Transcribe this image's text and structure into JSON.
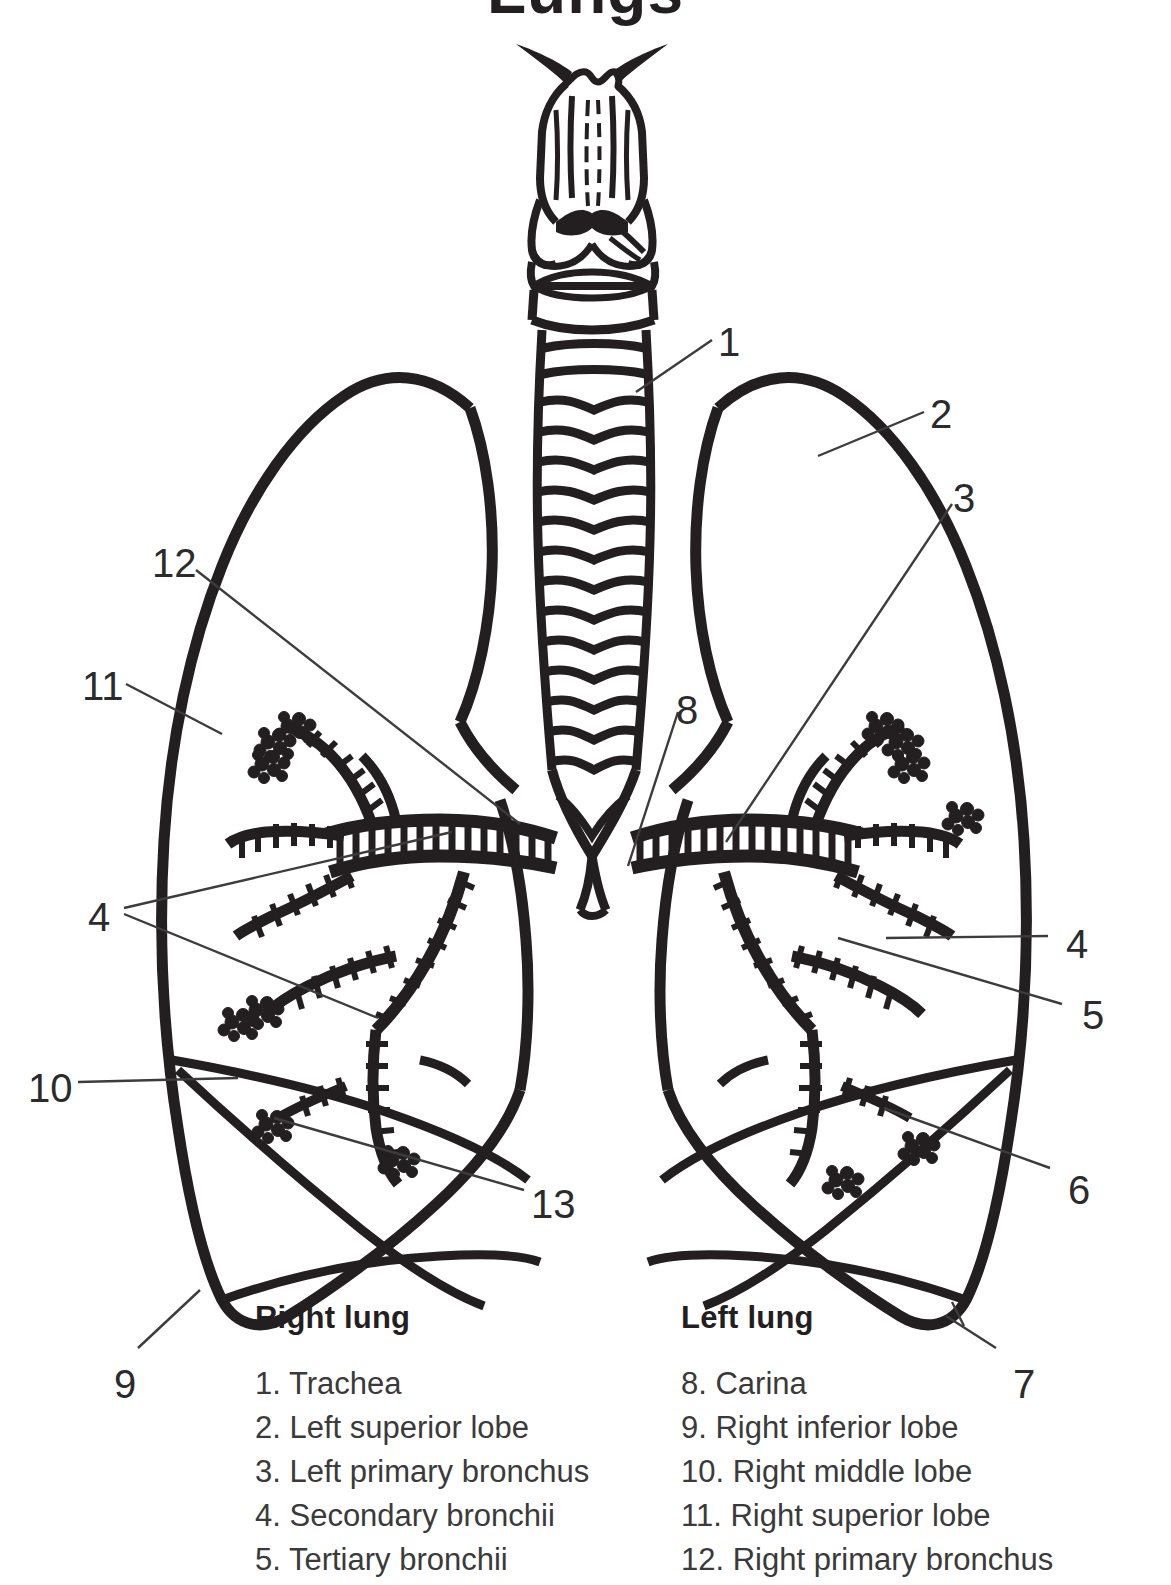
{
  "title": "Lungs",
  "figure": {
    "alt_name": "lungs-anatomy-line-drawing",
    "ink_color": "#231f20",
    "leader_color": "#3c3c3c",
    "background": "#ffffff"
  },
  "callouts": [
    {
      "id": "1",
      "label": "1",
      "x": 718,
      "y": 322,
      "refers_to": "Trachea"
    },
    {
      "id": "2",
      "label": "2",
      "x": 930,
      "y": 394,
      "refers_to": "Left superior lobe"
    },
    {
      "id": "3",
      "label": "3",
      "x": 953,
      "y": 478,
      "refers_to": "Left primary bronchus"
    },
    {
      "id": "12",
      "label": "12",
      "x": 152,
      "y": 543,
      "refers_to": "Right primary bronchus"
    },
    {
      "id": "11",
      "label": "11",
      "x": 82,
      "y": 666,
      "refers_to": "Right superior lobe"
    },
    {
      "id": "8",
      "label": "8",
      "x": 676,
      "y": 690,
      "refers_to": "Carina"
    },
    {
      "id": "4L",
      "label": "4",
      "x": 88,
      "y": 897,
      "refers_to": "Secondary bronchii"
    },
    {
      "id": "4R",
      "label": "4",
      "x": 1066,
      "y": 924,
      "refers_to": "Secondary bronchii"
    },
    {
      "id": "5",
      "label": "5",
      "x": 1082,
      "y": 995,
      "refers_to": "Tertiary bronchii"
    },
    {
      "id": "10",
      "label": "10",
      "x": 28,
      "y": 1068,
      "refers_to": "Right middle lobe"
    },
    {
      "id": "6",
      "label": "6",
      "x": 1068,
      "y": 1170,
      "refers_to": "Left inferior lobe"
    },
    {
      "id": "13",
      "label": "13",
      "x": 531,
      "y": 1184,
      "refers_to": "Bronchiole"
    },
    {
      "id": "9",
      "label": "9",
      "x": 114,
      "y": 1364,
      "refers_to": "Right inferior lobe"
    },
    {
      "id": "7",
      "label": "7",
      "x": 1013,
      "y": 1364,
      "refers_to": "Left primary bronchus base"
    }
  ],
  "legend": {
    "left": {
      "heading": "Right lung",
      "items": [
        "1. Trachea",
        "2. Left superior lobe",
        "3. Left primary bronchus",
        "4. Secondary bronchii",
        "5. Tertiary bronchii"
      ]
    },
    "right": {
      "heading": "Left lung",
      "items": [
        "8. Carina",
        "9. Right inferior lobe",
        "10. Right middle lobe",
        "11. Right superior lobe",
        "12. Right primary bronchus"
      ]
    }
  }
}
